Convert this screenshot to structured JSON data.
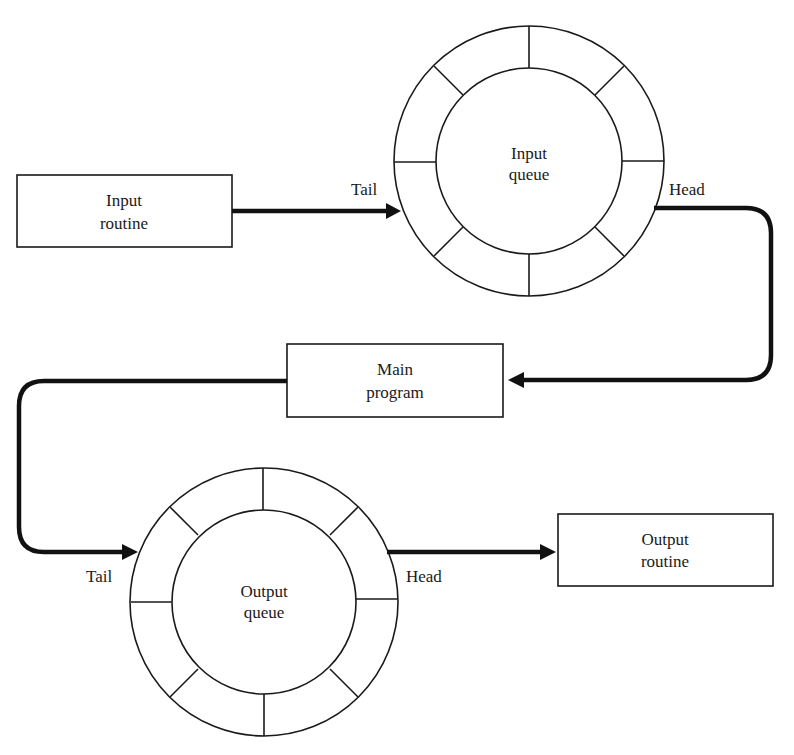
{
  "diagram": {
    "colors": {
      "ink": "#1a1a1a",
      "arrow": "#111111",
      "background": "#ffffff"
    },
    "nodes": {
      "input_routine": {
        "line1": "Input",
        "line2": "routine"
      },
      "input_queue": {
        "line1": "Input",
        "line2": "queue",
        "segments": 8
      },
      "main_program": {
        "line1": "Main",
        "line2": "program"
      },
      "output_queue": {
        "line1": "Output",
        "line2": "queue",
        "segments": 8
      },
      "output_routine": {
        "line1": "Output",
        "line2": "routine"
      }
    },
    "labels": {
      "input_queue_tail": "Tail",
      "input_queue_head": "Head",
      "output_queue_tail": "Tail",
      "output_queue_head": "Head"
    },
    "edges": [
      {
        "from": "Input routine",
        "to": "Input queue (Tail)"
      },
      {
        "from": "Input queue (Head)",
        "to": "Main program"
      },
      {
        "from": "Main program",
        "to": "Output queue (Tail)"
      },
      {
        "from": "Output queue (Head)",
        "to": "Output routine"
      }
    ]
  }
}
